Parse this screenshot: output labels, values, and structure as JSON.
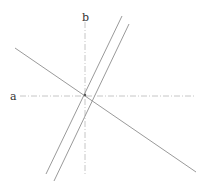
{
  "diagram": {
    "labels": {
      "axis_a": "a",
      "axis_b": "b"
    },
    "colors": {
      "axis": "#b8b8b8",
      "line": "#9a9a9a",
      "label": "#333333",
      "point": "#555555"
    },
    "axes": [
      {
        "name": "a",
        "orientation": "horizontal",
        "style": "dash-dot",
        "x1": 20,
        "y1": 96,
        "x2": 196,
        "y2": 96
      },
      {
        "name": "b",
        "orientation": "vertical",
        "style": "dash-dot",
        "x1": 85,
        "y1": 22,
        "x2": 85,
        "y2": 175
      }
    ],
    "lines": [
      {
        "name": "transversal",
        "x1": 15,
        "y1": 48,
        "x2": 196,
        "y2": 172
      },
      {
        "name": "parallel-1",
        "x1": 122,
        "y1": 16,
        "x2": 46,
        "y2": 174
      },
      {
        "name": "parallel-2",
        "x1": 129,
        "y1": 24,
        "x2": 54,
        "y2": 181
      }
    ],
    "point": {
      "x": 85,
      "y": 95
    }
  }
}
